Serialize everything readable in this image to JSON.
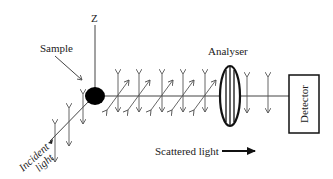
{
  "diagram": {
    "labels": {
      "z_axis": "Z",
      "sample": "Sample",
      "analyser": "Analyser",
      "detector": "Detector",
      "incident_line1": "Incident",
      "incident_line2": "light",
      "scattered": "Scattered light"
    },
    "colors": {
      "line": "#444444",
      "sample_fill": "#000000",
      "text": "#222222"
    }
  }
}
